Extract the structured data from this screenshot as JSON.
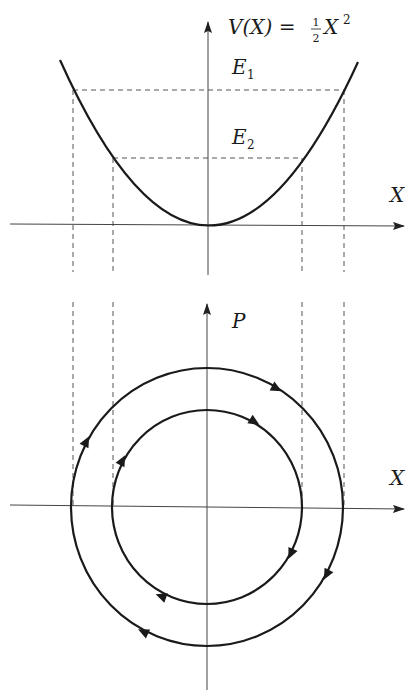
{
  "potential_plot": {
    "formula_lhs": "V(X) = ",
    "formula_num": "1",
    "formula_den": "2",
    "formula_rhs": "X",
    "formula_exp": "2",
    "energy_labels": [
      {
        "base": "E",
        "sub": "1"
      },
      {
        "base": "E",
        "sub": "2"
      }
    ],
    "x_axis_label": "X"
  },
  "phase_plot": {
    "y_axis_label": "P",
    "x_axis_label": "X"
  },
  "colors": {
    "curve": "#1a1a1a",
    "axis": "#444444",
    "dashed": "#555555"
  }
}
